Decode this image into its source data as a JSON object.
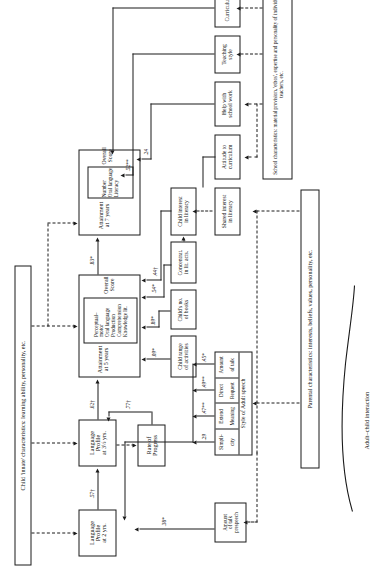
{
  "figure": {
    "type": "path-diagram",
    "orientation": "rotated-90",
    "side_caption_left": "Adult–child interaction"
  },
  "context_boxes": {
    "child_innate": "Child 'innate' characteristics: learning ability, personality, etc.",
    "parental": "Parental characteristics:  interests, beliefs, values, personality, etc.",
    "school": "School characteristics:  material provision, 'ethos', expertise and personality of individual teachers, etc."
  },
  "nodes": {
    "attainment7": {
      "title": "Attainment\nat 7 years",
      "title_l1": "Attainment",
      "title_l2": "at 7 years",
      "items": [
        "Number",
        "Oral language",
        "Literacy"
      ],
      "overall": "Overall Score"
    },
    "attainment5": {
      "title_l1": "Attainment",
      "title_l2": "at 5 years",
      "items": [
        "Perceptual–",
        "motor",
        "Oral language",
        "Production",
        "Comprehension",
        "Knowledge lit."
      ],
      "overall": "Overall Score"
    },
    "language35": {
      "l1": "Language",
      "l2": "Profile",
      "l3": "at 3½ yrs."
    },
    "language2": {
      "l1": "Language",
      "l2": "Profile",
      "l3": "at 2 yrs."
    },
    "rate_progress": {
      "l1": "Rate of",
      "l2": "Progress"
    },
    "child_range": {
      "l1": "Child range",
      "l2": "of activities"
    },
    "childs_books": {
      "l1": "Child's no.",
      "l2": "of books"
    },
    "concentration": {
      "l1": "Concentrat.",
      "l2": "in lit. acts."
    },
    "child_interest": {
      "l1": "Child interest",
      "l2": "in literacy"
    },
    "shared_interest": {
      "l1": "Shared interest",
      "l2": "in literacy"
    },
    "attitude_curriculum": {
      "l1": "Attitude to",
      "l2": "curriculum"
    },
    "help_school": {
      "l1": "Help with",
      "l2": "school work"
    },
    "teaching_style": {
      "l1": "Teaching",
      "l2": "style"
    },
    "curriculum": {
      "l1": "Curriculum"
    },
    "amount_talk_pre": {
      "l1": "Amount",
      "l2": "of talk",
      "l3": "prespeech"
    },
    "style_adult_speech": {
      "title": "Style of Adult speech",
      "cells": [
        {
          "l1": "Simpli-",
          "l2": "city"
        },
        {
          "l1": "Extend",
          "l2": "Meaning"
        },
        {
          "l1": "Direct",
          "l2": "Request"
        },
        {
          "l1": "Amount",
          "l2": "of talk"
        }
      ]
    }
  },
  "coefficients": {
    "att5_to_att7": ".83*",
    "lang35_to_att5": ".62†",
    "lang2_to_lang35": ".57†",
    "rate_to_lang35": ".77†",
    "childrange_to_att5": ".09*",
    "childbooks_to_att5": ".89*",
    "concentration_to_att5": ".54*",
    "childinterest_to_att5": ".44†",
    "help_to_att7": ".24",
    "teaching_to_att7": ".52**",
    "simplicity": ".29",
    "extend_meaning": ".47**",
    "direct_request": ".49**",
    "amount_of_talk": ".45*",
    "amount_prespeech_to_lang2": ".38*"
  },
  "colors": {
    "ink": "#1a1a1a",
    "paper": "#ffffff"
  }
}
